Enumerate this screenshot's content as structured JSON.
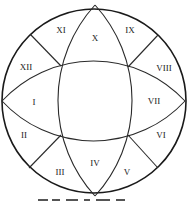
{
  "diagram": {
    "type": "circle-divided-into-twelve-regions",
    "colors": {
      "stroke": "#1a1a1a",
      "label": "#222222",
      "background": "#ffffff"
    },
    "regions": [
      {
        "id": "I",
        "label": "I",
        "x": 34,
        "y": 102
      },
      {
        "id": "II",
        "label": "II",
        "x": 24,
        "y": 135
      },
      {
        "id": "III",
        "label": "III",
        "x": 60,
        "y": 172
      },
      {
        "id": "IV",
        "label": "IV",
        "x": 95,
        "y": 163
      },
      {
        "id": "V",
        "label": "V",
        "x": 127,
        "y": 172
      },
      {
        "id": "VI",
        "label": "VI",
        "x": 161,
        "y": 135
      },
      {
        "id": "VII",
        "label": "VII",
        "x": 154,
        "y": 101
      },
      {
        "id": "VIII",
        "label": "VIII",
        "x": 164,
        "y": 68
      },
      {
        "id": "IX",
        "label": "IX",
        "x": 130,
        "y": 30
      },
      {
        "id": "X",
        "label": "X",
        "x": 95,
        "y": 38
      },
      {
        "id": "XI",
        "label": "XI",
        "x": 61,
        "y": 30
      },
      {
        "id": "XII",
        "label": "XII",
        "x": 26,
        "y": 67
      }
    ]
  }
}
